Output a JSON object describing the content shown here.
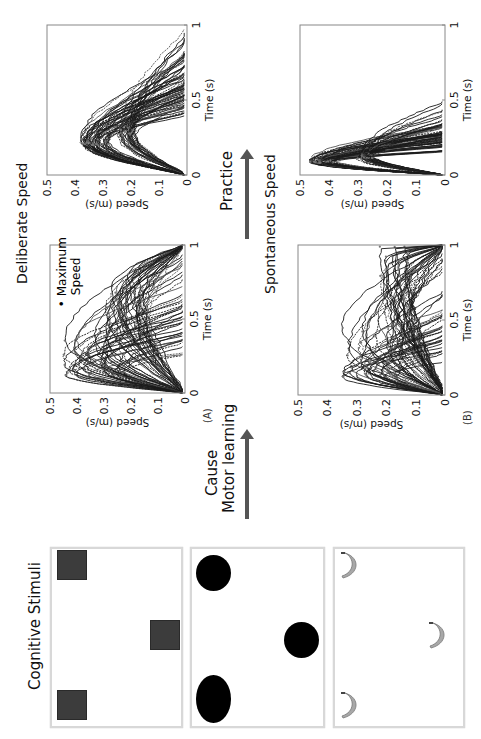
{
  "figure": {
    "orientation": "rotated 90 degrees counter-clockwise on page",
    "stimuli": {
      "title": "Cognitive Stimuli",
      "panels": [
        {
          "name": "squares",
          "shape": "square",
          "count": 3,
          "color": "#3c3c3c"
        },
        {
          "name": "circles",
          "shape": "circle",
          "count": 3,
          "color": "#000000"
        },
        {
          "name": "bananas",
          "shape": "banana",
          "count": 3,
          "color": "#9a9a9a"
        }
      ]
    },
    "arrows": {
      "motor_learning": {
        "line1": "Cause",
        "line2": "Motor learning"
      },
      "practice": {
        "label": "Practice"
      }
    },
    "row_labels": {
      "deliberate": "Deliberate Speed",
      "spontaneous": "Spontaneous Speed"
    },
    "panel_tags": {
      "a": "(A)",
      "b": "(B)"
    },
    "legend": {
      "marker": "•",
      "line1": "Maximum",
      "line2": "Speed"
    },
    "axes": {
      "xlabel": "Time (s)",
      "ylabel": "Speed (m/s)",
      "xticks": [
        "0",
        "0.5",
        "1"
      ],
      "yticks": [
        "0",
        "0.1",
        "0.2",
        "0.3",
        "0.4",
        "0.5"
      ]
    }
  },
  "chart_data": [
    {
      "id": "A-deliberate-before",
      "type": "line",
      "title": "(A) Deliberate Speed - before practice",
      "xlabel": "Time (s)",
      "ylabel": "Speed (m/s)",
      "xlim": [
        0,
        1
      ],
      "ylim": [
        0,
        0.5
      ],
      "series_description": "many overlapping bell-shaped speed profiles; peaks mostly 0.3-0.45 m/s at 0.15-0.3 s, some long tails to 1 s",
      "peak_speed_range": [
        0.2,
        0.46
      ],
      "peak_time_range": [
        0.12,
        0.85
      ],
      "legend": [
        "Maximum Speed"
      ]
    },
    {
      "id": "A-deliberate-after",
      "type": "line",
      "title": "Deliberate Speed - after practice",
      "xlabel": "Time (s)",
      "ylabel": "Speed (m/s)",
      "xlim": [
        0,
        1
      ],
      "ylim": [
        0,
        0.5
      ],
      "series_description": "tighter cluster of profiles; peaks ~0.3-0.38 m/s at 0.2-0.3 s, ending by ~0.7 s",
      "peak_speed_range": [
        0.28,
        0.38
      ],
      "peak_time_range": [
        0.2,
        0.32
      ]
    },
    {
      "id": "B-spontaneous-before",
      "type": "line",
      "title": "(B) Spontaneous Speed - before practice",
      "xlabel": "Time (s)",
      "ylabel": "Speed (m/s)",
      "xlim": [
        0,
        1
      ],
      "ylim": [
        0,
        0.5
      ],
      "series_description": "widely dispersed profiles; peaks ~0.2-0.35 m/s spread from 0.12 to 1.0 s",
      "peak_speed_range": [
        0.15,
        0.35
      ],
      "peak_time_range": [
        0.12,
        1.0
      ]
    },
    {
      "id": "B-spontaneous-after",
      "type": "line",
      "title": "Spontaneous Speed - after practice",
      "xlabel": "Time (s)",
      "ylabel": "Speed (m/s)",
      "xlim": [
        0,
        1
      ],
      "ylim": [
        0,
        0.5
      ],
      "series_description": "sharp early peaks ~0.4-0.47 m/s at ~0.08-0.15 s, decaying to ~0.85 s",
      "peak_speed_range": [
        0.38,
        0.47
      ],
      "peak_time_range": [
        0.08,
        0.15
      ]
    }
  ]
}
